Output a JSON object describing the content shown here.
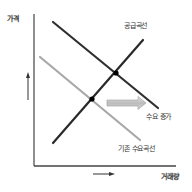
{
  "diagram": {
    "type": "supply-demand",
    "labels": {
      "y_axis": "가격",
      "x_axis": "거래량",
      "supply_curve": "공급곡선",
      "demand_increase": "수요 증가",
      "original_demand_curve": "기존 수요곡선"
    },
    "colors": {
      "axis": "#333333",
      "supply": "#2a2a2a",
      "new_demand": "#2f2f2f",
      "original_demand": "#a8a8a8",
      "shift_arrow": "#bdbdbd",
      "equilibrium_point": "#000000"
    },
    "curves": {
      "supply": {
        "from": [
          53,
          143
        ],
        "to": [
          143,
          40
        ]
      },
      "new_demand": {
        "from": [
          53,
          22
        ],
        "to": [
          158,
          108
        ]
      },
      "original_demand": {
        "from": [
          40,
          57
        ],
        "to": [
          140,
          140
        ]
      }
    },
    "equilibria": [
      {
        "name": "original",
        "x": 92,
        "y": 99
      },
      {
        "name": "new",
        "x": 116,
        "y": 73
      }
    ],
    "shift_arrow": {
      "from": [
        107,
        103
      ],
      "to": [
        145,
        103
      ]
    }
  }
}
